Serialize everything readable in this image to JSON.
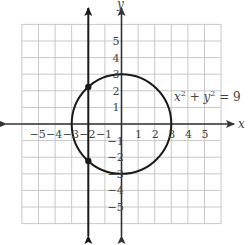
{
  "figure": {
    "type": "coordinate-graph",
    "x_axis_label": "x",
    "y_axis_label": "y",
    "x_ticks": [
      "−5",
      "−4",
      "−3",
      "−2",
      "−1",
      "1",
      "2",
      "3",
      "4",
      "5"
    ],
    "y_ticks": [
      "5",
      "4",
      "3",
      "2",
      "1",
      "−1",
      "−2",
      "−3",
      "−4",
      "−5"
    ],
    "equation": {
      "base": "x",
      "exp1": "2",
      "plus": " + y",
      "exp2": "2",
      "rhs": " = 9"
    },
    "circle": {
      "center": [
        0,
        0
      ],
      "radius": 3
    },
    "vertical_line": {
      "x": -2
    },
    "intersection_points": [
      [
        -2,
        2.236
      ],
      [
        -2,
        -2.236
      ]
    ],
    "grid_range": {
      "x": [
        -6,
        6
      ],
      "y": [
        -6,
        6
      ]
    },
    "colors": {
      "grid": "#c8c8c8",
      "axes": "#333333",
      "curve": "#1a1a1a"
    }
  }
}
